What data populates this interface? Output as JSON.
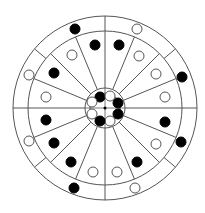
{
  "diagram": {
    "title": "",
    "center": [
      105,
      108
    ],
    "colors": {
      "line": "#555555",
      "filled": "#000000",
      "empty_fill": "#ffffff",
      "empty_stroke": "#555555",
      "background": "#ffffff"
    },
    "rings": {
      "outer": 92,
      "middle": 77,
      "hub_outer": 20,
      "hub_inner": 15
    },
    "outer_ring_divider_angles_deg": [
      -90,
      -40,
      0,
      40,
      90,
      140,
      180,
      220
    ],
    "inner_spoke_angles_deg": [
      -90,
      -67.5,
      -45,
      -22.5,
      0,
      22.5,
      45,
      67.5,
      90,
      112.5,
      135,
      157.5,
      180,
      202.5,
      225,
      247.5
    ],
    "outer_ring_dots": [
      {
        "x": 75,
        "y": 29,
        "filled": true
      },
      {
        "x": 137,
        "y": 29,
        "filled": false
      },
      {
        "x": 182,
        "y": 77,
        "filled": true
      },
      {
        "x": 181,
        "y": 142,
        "filled": true
      },
      {
        "x": 135,
        "y": 188,
        "filled": false
      },
      {
        "x": 74,
        "y": 188,
        "filled": true
      },
      {
        "x": 29,
        "y": 141,
        "filled": false
      },
      {
        "x": 29,
        "y": 75,
        "filled": false
      }
    ],
    "middle_ring_dots": [
      {
        "x": 95,
        "y": 45,
        "filled": true
      },
      {
        "x": 119,
        "y": 45,
        "filled": true
      },
      {
        "x": 139,
        "y": 56,
        "filled": false
      },
      {
        "x": 156,
        "y": 74,
        "filled": false
      },
      {
        "x": 165,
        "y": 97,
        "filled": false
      },
      {
        "x": 165,
        "y": 122,
        "filled": true
      },
      {
        "x": 156,
        "y": 144,
        "filled": false
      },
      {
        "x": 137,
        "y": 162,
        "filled": true
      },
      {
        "x": 117,
        "y": 172,
        "filled": false
      },
      {
        "x": 93,
        "y": 172,
        "filled": false
      },
      {
        "x": 71,
        "y": 162,
        "filled": true
      },
      {
        "x": 54,
        "y": 143,
        "filled": true
      },
      {
        "x": 46,
        "y": 120,
        "filled": true
      },
      {
        "x": 46,
        "y": 97,
        "filled": false
      },
      {
        "x": 54,
        "y": 73,
        "filled": true
      },
      {
        "x": 72,
        "y": 55,
        "filled": false
      }
    ],
    "hub_dots": [
      {
        "x": 100,
        "y": 97,
        "filled": true
      },
      {
        "x": 110,
        "y": 96,
        "filled": false
      },
      {
        "x": 118,
        "y": 103,
        "filled": true
      },
      {
        "x": 118,
        "y": 114,
        "filled": true
      },
      {
        "x": 110,
        "y": 121,
        "filled": false
      },
      {
        "x": 100,
        "y": 121,
        "filled": true
      },
      {
        "x": 92,
        "y": 114,
        "filled": false
      },
      {
        "x": 92,
        "y": 102,
        "filled": false
      }
    ],
    "dot_radius": 5
  }
}
